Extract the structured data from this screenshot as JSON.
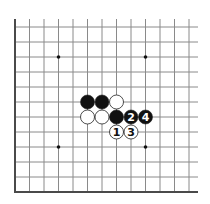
{
  "diagram": {
    "type": "go-board-corner",
    "corner": "bottom-left",
    "colors": {
      "background": "#ffffff",
      "grid_line": "#8a8a8a",
      "edge_line": "#4a4a4a",
      "black_stone": "#111111",
      "white_stone": "#ffffff",
      "stone_outline": "#222222",
      "star_point": "#111111"
    },
    "grid": {
      "columns": 13,
      "rows": 12,
      "origin_x": 15,
      "origin_y": 27,
      "col_spacing": 14.5,
      "row_spacing": 15,
      "top_extend_to_y": 19,
      "right_extend_to_x": 198
    },
    "star_points": [
      {
        "col": 3,
        "row": 2
      },
      {
        "col": 9,
        "row": 2
      },
      {
        "col": 3,
        "row": 8
      },
      {
        "col": 9,
        "row": 8
      }
    ],
    "stones": [
      {
        "color": "black",
        "col": 5,
        "row": 5,
        "label": ""
      },
      {
        "color": "black",
        "col": 6,
        "row": 5,
        "label": ""
      },
      {
        "color": "white",
        "col": 7,
        "row": 5,
        "label": ""
      },
      {
        "color": "white",
        "col": 5,
        "row": 6,
        "label": ""
      },
      {
        "color": "white",
        "col": 6,
        "row": 6,
        "label": ""
      },
      {
        "color": "black",
        "col": 7,
        "row": 6,
        "label": ""
      },
      {
        "color": "black",
        "col": 8,
        "row": 6,
        "label": "2"
      },
      {
        "color": "black",
        "col": 9,
        "row": 6,
        "label": "4"
      },
      {
        "color": "white",
        "col": 7,
        "row": 7,
        "label": "1"
      },
      {
        "color": "white",
        "col": 8,
        "row": 7,
        "label": "3"
      }
    ]
  }
}
